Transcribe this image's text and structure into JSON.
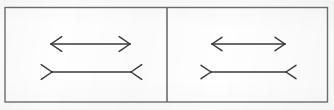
{
  "figure": {
    "name": "muller-lyer-illusion",
    "background_color": "#fefefe",
    "ink_color": "#3a3a3a",
    "border_color": "#6e6e6e",
    "canvas": {
      "width": 334,
      "height": 110
    },
    "frame": {
      "x": 5,
      "y": 7.5,
      "width": 322.5,
      "height": 94.5,
      "stroke_width": 1.4
    },
    "divider": {
      "x": 167,
      "y1": 7.5,
      "y2": 102,
      "stroke_width": 1.6
    },
    "panels": [
      {
        "id": "panel-left",
        "label": "Left panel",
        "shafts": [
          {
            "id": "left-top-shaft",
            "label": "Top line with outward arrowheads",
            "arrow_style": "arrows-out",
            "x1": 51,
            "x2": 130,
            "y": 44,
            "length_px": 79,
            "fin_length": 13,
            "fin_angle_deg": 34,
            "stroke_width": 1.5
          },
          {
            "id": "left-bottom-shaft",
            "label": "Bottom line with inward fins",
            "arrow_style": "fins-in",
            "x1": 52,
            "x2": 131,
            "y": 72,
            "length_px": 79,
            "fin_length": 13,
            "fin_angle_deg": 34,
            "stroke_width": 1.5
          }
        ]
      },
      {
        "id": "panel-right",
        "label": "Right panel",
        "shafts": [
          {
            "id": "right-top-shaft",
            "label": "Top line with outward arrowheads",
            "arrow_style": "arrows-out",
            "x1": 212,
            "x2": 285,
            "y": 44,
            "length_px": 73,
            "fin_length": 12,
            "fin_angle_deg": 34,
            "stroke_width": 1.5
          },
          {
            "id": "right-bottom-shaft",
            "label": "Bottom line with inward fins",
            "arrow_style": "fins-in",
            "x1": 211,
            "x2": 286,
            "y": 72,
            "length_px": 75,
            "fin_length": 12,
            "fin_angle_deg": 34,
            "stroke_width": 1.5
          }
        ]
      }
    ]
  }
}
